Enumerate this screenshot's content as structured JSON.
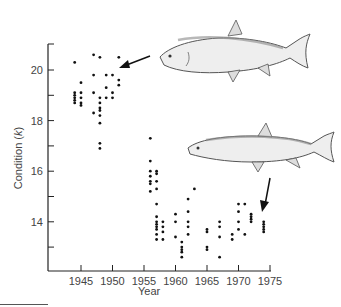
{
  "chart_data": {
    "type": "scatter",
    "title": "",
    "xlabel": "Year",
    "ylabel": "Condition (k)",
    "xlim": [
      1940,
      1975
    ],
    "ylim": [
      12.2,
      21
    ],
    "xticks": [
      1945,
      1950,
      1955,
      1960,
      1965,
      1970,
      1975
    ],
    "yticks": [
      14,
      16,
      18,
      20
    ],
    "y_minor_ticks": [
      13,
      15,
      17,
      19
    ],
    "grid": false,
    "legend": null,
    "annotations": [
      {
        "type": "image",
        "label": "fish-robust",
        "description": "illustration of a deep-bodied fish pointing to high condition values around 1950",
        "arrow_to": [
          1951,
          20.1
        ]
      },
      {
        "type": "image",
        "label": "fish-slender",
        "description": "illustration of a slender fish pointing to low condition values around 1974",
        "arrow_to": [
          1974,
          14.2
        ]
      }
    ],
    "series": [
      {
        "name": "Condition (k)",
        "points": [
          [
            1944,
            20.3
          ],
          [
            1944,
            19.1
          ],
          [
            1944,
            19.0
          ],
          [
            1944,
            18.9
          ],
          [
            1944,
            18.8
          ],
          [
            1944,
            18.7
          ],
          [
            1945,
            19.5
          ],
          [
            1945,
            19.1
          ],
          [
            1945,
            18.9
          ],
          [
            1945,
            18.7
          ],
          [
            1945,
            18.6
          ],
          [
            1947,
            20.6
          ],
          [
            1947,
            19.8
          ],
          [
            1947,
            19.1
          ],
          [
            1947,
            18.3
          ],
          [
            1948,
            20.5
          ],
          [
            1948,
            18.9
          ],
          [
            1948,
            18.7
          ],
          [
            1948,
            18.5
          ],
          [
            1948,
            18.4
          ],
          [
            1948,
            18.2
          ],
          [
            1948,
            17.9
          ],
          [
            1948,
            17.1
          ],
          [
            1948,
            16.9
          ],
          [
            1949,
            19.8
          ],
          [
            1949,
            19.3
          ],
          [
            1949,
            18.9
          ],
          [
            1950,
            19.8
          ],
          [
            1950,
            19.1
          ],
          [
            1950,
            18.9
          ],
          [
            1951,
            20.5
          ],
          [
            1951,
            19.6
          ],
          [
            1951,
            19.4
          ],
          [
            1956,
            16.4
          ],
          [
            1956,
            16.0
          ],
          [
            1956,
            15.8
          ],
          [
            1956,
            15.6
          ],
          [
            1956,
            15.5
          ],
          [
            1956,
            15.2
          ],
          [
            1956,
            17.3
          ],
          [
            1957,
            16.0
          ],
          [
            1957,
            15.9
          ],
          [
            1957,
            15.6
          ],
          [
            1957,
            15.3
          ],
          [
            1957,
            14.7
          ],
          [
            1957,
            14.2
          ],
          [
            1957,
            14.0
          ],
          [
            1957,
            13.9
          ],
          [
            1957,
            13.8
          ],
          [
            1957,
            13.7
          ],
          [
            1957,
            13.5
          ],
          [
            1957,
            13.3
          ],
          [
            1958,
            14.0
          ],
          [
            1958,
            13.8
          ],
          [
            1958,
            13.6
          ],
          [
            1958,
            13.3
          ],
          [
            1960,
            14.3
          ],
          [
            1960,
            14.0
          ],
          [
            1960,
            13.4
          ],
          [
            1961,
            13.2
          ],
          [
            1961,
            13.0
          ],
          [
            1961,
            12.9
          ],
          [
            1961,
            12.8
          ],
          [
            1961,
            12.6
          ],
          [
            1962,
            14.9
          ],
          [
            1962,
            14.4
          ],
          [
            1962,
            14.0
          ],
          [
            1962,
            13.8
          ],
          [
            1962,
            13.5
          ],
          [
            1963,
            15.3
          ],
          [
            1965,
            13.7
          ],
          [
            1965,
            13.6
          ],
          [
            1965,
            13.0
          ],
          [
            1965,
            12.9
          ],
          [
            1967,
            14.0
          ],
          [
            1967,
            13.8
          ],
          [
            1967,
            13.4
          ],
          [
            1967,
            12.6
          ],
          [
            1969,
            13.5
          ],
          [
            1969,
            13.3
          ],
          [
            1970,
            14.7
          ],
          [
            1970,
            14.4
          ],
          [
            1970,
            14.0
          ],
          [
            1970,
            13.7
          ],
          [
            1971,
            14.7
          ],
          [
            1971,
            13.5
          ],
          [
            1972,
            14.3
          ],
          [
            1972,
            14.2
          ],
          [
            1972,
            14.1
          ],
          [
            1972,
            14.0
          ],
          [
            1974,
            14.0
          ],
          [
            1974,
            13.9
          ],
          [
            1974,
            13.8
          ],
          [
            1974,
            13.7
          ],
          [
            1974,
            13.6
          ]
        ]
      }
    ]
  },
  "axes": {
    "x_title": "Year",
    "y_title": "Condition (",
    "y_title_italic": "k",
    "y_title_end": ")"
  }
}
